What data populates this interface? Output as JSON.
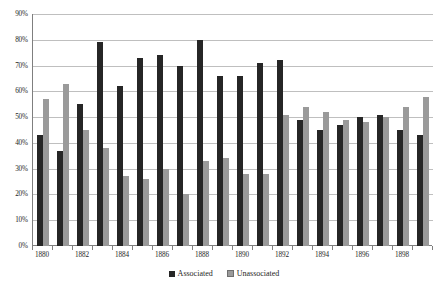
{
  "chart_data": {
    "type": "bar",
    "title": "",
    "subtitle": "",
    "xlabel": "",
    "ylabel": "",
    "ylim": [
      0,
      90
    ],
    "ytick_labels": [
      "0%",
      "10%",
      "20%",
      "30%",
      "40%",
      "50%",
      "60%",
      "70%",
      "80%",
      "90%"
    ],
    "ytick_values": [
      0,
      10,
      20,
      30,
      40,
      50,
      60,
      70,
      80,
      90
    ],
    "grid": true,
    "legend_position": "bottom",
    "categories": [
      "1880",
      "1881",
      "1882",
      "1883",
      "1884",
      "1885",
      "1886",
      "1887",
      "1888",
      "1889",
      "1890",
      "1891",
      "1892",
      "1893",
      "1894",
      "1895",
      "1896",
      "1897",
      "1898",
      "1899"
    ],
    "xtick_labels_shown": [
      "1880",
      "1882",
      "1884",
      "1886",
      "1888",
      "1890",
      "1892",
      "1894",
      "1896",
      "1898"
    ],
    "series": [
      {
        "name": "Associated",
        "color": "#262626",
        "values": [
          43,
          37,
          55,
          79,
          62,
          73,
          74,
          70,
          80,
          66,
          66,
          71,
          72,
          49,
          45,
          47,
          50,
          51,
          45,
          43
        ]
      },
      {
        "name": "Unassociated",
        "color": "#9a9a9a",
        "values": [
          57,
          63,
          45,
          38,
          27,
          26,
          30,
          20,
          33,
          34,
          28,
          28,
          51,
          54,
          52,
          49,
          48,
          50,
          54,
          58
        ]
      }
    ]
  },
  "legend": {
    "entries": [
      {
        "label": "Associated"
      },
      {
        "label": "Unassociated"
      }
    ]
  },
  "colors": {
    "associated": "#262626",
    "unassociated": "#9a9a9a",
    "gridline": "#bfbfbf",
    "axis": "#7f7f7f",
    "text": "#262626",
    "background": "#ffffff"
  }
}
